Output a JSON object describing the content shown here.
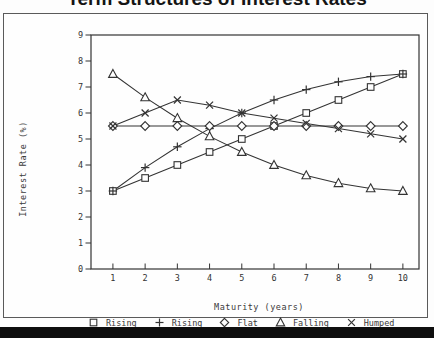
{
  "title": "Term Structures of Interest Rates",
  "colors": {
    "ink": "#333333",
    "frame": "#4a4a4a",
    "title_text": "#141414",
    "background": "#fdfdfd",
    "bottom_bar": "#0e0e0e"
  },
  "chart_data": {
    "type": "line",
    "title": "Term Structures of Interest Rates",
    "xlabel": "Maturity (years)",
    "ylabel": "Interest Rate (%)",
    "x": [
      1,
      2,
      3,
      4,
      5,
      6,
      7,
      8,
      9,
      10
    ],
    "xticks": [
      "1",
      "2",
      "3",
      "4",
      "5",
      "6",
      "7",
      "8",
      "9",
      "10"
    ],
    "yticks": [
      "0",
      "1",
      "2",
      "3",
      "4",
      "5",
      "6",
      "7",
      "8",
      "9"
    ],
    "xlim": [
      0.32,
      10.5
    ],
    "ylim": [
      0,
      9
    ],
    "grid": false,
    "legend_position": "bottom",
    "series": [
      {
        "name": "Rising",
        "marker": "square",
        "glyph": "□",
        "values": [
          3.0,
          3.5,
          4.0,
          4.5,
          5.0,
          5.5,
          6.0,
          6.5,
          7.0,
          7.5
        ]
      },
      {
        "name": "Rising",
        "marker": "plus",
        "glyph": "+",
        "values": [
          3.0,
          3.9,
          4.7,
          5.4,
          6.0,
          6.5,
          6.9,
          7.2,
          7.4,
          7.5
        ]
      },
      {
        "name": "Flat",
        "marker": "diamond",
        "glyph": "◇",
        "values": [
          5.5,
          5.5,
          5.5,
          5.5,
          5.5,
          5.5,
          5.5,
          5.5,
          5.5,
          5.5
        ]
      },
      {
        "name": "Falling",
        "marker": "triangle",
        "glyph": "△",
        "values": [
          7.5,
          6.6,
          5.8,
          5.1,
          4.5,
          4.0,
          3.6,
          3.3,
          3.1,
          3.0
        ]
      },
      {
        "name": "Humped",
        "marker": "x",
        "glyph": "×",
        "values": [
          5.5,
          6.0,
          6.5,
          6.3,
          6.0,
          5.8,
          5.6,
          5.4,
          5.2,
          5.0
        ]
      }
    ]
  }
}
